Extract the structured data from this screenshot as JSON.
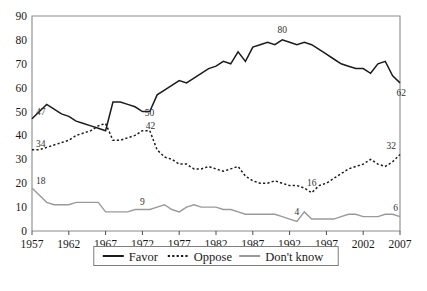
{
  "chart_data": {
    "type": "line",
    "title": "",
    "subtitle": "",
    "xlabel": "",
    "ylabel": "",
    "xlim": [
      1957,
      2007
    ],
    "ylim": [
      0,
      90
    ],
    "ytick_step": 10,
    "yticks": [
      0,
      10,
      20,
      30,
      40,
      50,
      60,
      70,
      80,
      90
    ],
    "xticks": [
      1957,
      1962,
      1967,
      1972,
      1977,
      1982,
      1987,
      1992,
      1997,
      2002,
      2007
    ],
    "grid": false,
    "legend_position": "bottom-center",
    "x": [
      1957,
      1958,
      1959,
      1960,
      1961,
      1962,
      1963,
      1964,
      1965,
      1966,
      1967,
      1968,
      1969,
      1970,
      1971,
      1972,
      1973,
      1974,
      1975,
      1976,
      1977,
      1978,
      1979,
      1980,
      1981,
      1982,
      1983,
      1984,
      1985,
      1986,
      1987,
      1988,
      1989,
      1990,
      1991,
      1992,
      1993,
      1994,
      1995,
      1996,
      1997,
      1998,
      1999,
      2000,
      2001,
      2002,
      2003,
      2004,
      2005,
      2006,
      2007
    ],
    "series": [
      {
        "name": "Favor",
        "style": "solid-black",
        "color": "#1b1b1b",
        "values": [
          47,
          50,
          53,
          51,
          49,
          48,
          46,
          45,
          44,
          43,
          42,
          54,
          54,
          53,
          52,
          50,
          50,
          57,
          59,
          61,
          63,
          62,
          64,
          66,
          68,
          69,
          71,
          70,
          75,
          71,
          77,
          78,
          79,
          78,
          80,
          79,
          78,
          79,
          78,
          76,
          74,
          72,
          70,
          69,
          68,
          68,
          66,
          70,
          71,
          65,
          62
        ]
      },
      {
        "name": "Oppose",
        "style": "dotted-black",
        "color": "#1b1b1b",
        "values": [
          34,
          34,
          35,
          36,
          37,
          38,
          40,
          41,
          42,
          44,
          45,
          38,
          38,
          39,
          40,
          42,
          42,
          34,
          31,
          30,
          28,
          28,
          26,
          26,
          27,
          26,
          25,
          26,
          27,
          23,
          21,
          20,
          20,
          21,
          20,
          19,
          19,
          18,
          16,
          19,
          20,
          22,
          24,
          26,
          27,
          28,
          30,
          28,
          27,
          29,
          32
        ]
      },
      {
        "name": "Don't know",
        "style": "solid-gray",
        "color": "#9a9a9a",
        "values": [
          18,
          15,
          12,
          11,
          11,
          11,
          12,
          12,
          12,
          12,
          8,
          8,
          8,
          8,
          9,
          9,
          9,
          10,
          11,
          9,
          8,
          10,
          11,
          10,
          10,
          10,
          9,
          9,
          8,
          7,
          7,
          7,
          7,
          7,
          6,
          5,
          4,
          8,
          5,
          5,
          5,
          5,
          6,
          7,
          7,
          6,
          6,
          6,
          7,
          7,
          6
        ]
      }
    ],
    "annotations": [
      {
        "label": "47",
        "series": "Favor",
        "x": 1957,
        "y": 47
      },
      {
        "label": "50",
        "series": "Favor",
        "x": 1972,
        "y": 50
      },
      {
        "label": "80",
        "series": "Favor",
        "x": 1991,
        "y": 80
      },
      {
        "label": "62",
        "series": "Favor",
        "x": 2007,
        "y": 62
      },
      {
        "label": "34",
        "series": "Oppose",
        "x": 1957,
        "y": 34
      },
      {
        "label": "42",
        "series": "Oppose",
        "x": 1972,
        "y": 42
      },
      {
        "label": "16",
        "series": "Oppose",
        "x": 1995,
        "y": 16
      },
      {
        "label": "32",
        "series": "Oppose",
        "x": 2007,
        "y": 32
      },
      {
        "label": "18",
        "series": "Don't know",
        "x": 1957,
        "y": 18
      },
      {
        "label": "9",
        "series": "Don't know",
        "x": 1972,
        "y": 9
      },
      {
        "label": "4",
        "series": "Don't know",
        "x": 1993,
        "y": 4
      },
      {
        "label": "6",
        "series": "Don't know",
        "x": 2007,
        "y": 6
      }
    ]
  },
  "axes": {
    "y_labels": [
      "90",
      "80",
      "70",
      "60",
      "50",
      "40",
      "30",
      "20",
      "10",
      "0"
    ],
    "x_labels": [
      "1957",
      "1962",
      "1967",
      "1972",
      "1977",
      "1982",
      "1987",
      "1992",
      "1997",
      "2002",
      "2007"
    ]
  },
  "legend": {
    "items": [
      {
        "label": "Favor",
        "swatch": "solid-black-line"
      },
      {
        "label": "Oppose",
        "swatch": "dotted-black-line"
      },
      {
        "label": "Don't know",
        "swatch": "solid-gray-line"
      }
    ]
  },
  "caption": {
    "text": ""
  }
}
